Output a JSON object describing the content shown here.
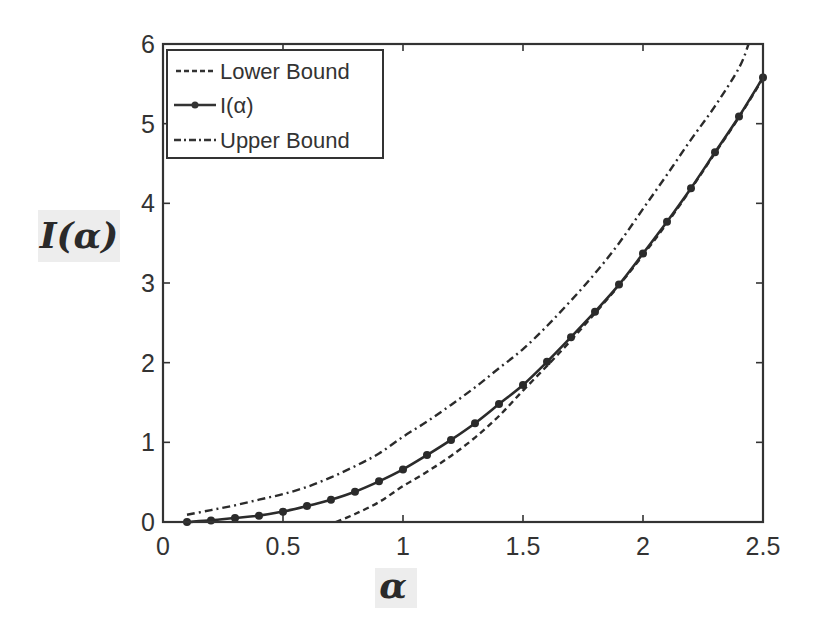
{
  "chart_data": {
    "type": "line",
    "title": "",
    "xlabel": "α",
    "ylabel": "I(α)",
    "xlim": [
      0,
      2.5
    ],
    "ylim": [
      0,
      6
    ],
    "xticks": [
      0,
      0.5,
      1,
      1.5,
      2,
      2.5
    ],
    "xtick_labels": [
      "0",
      "0.5",
      "1",
      "1.5",
      "2",
      "2.5"
    ],
    "yticks": [
      0,
      1,
      2,
      3,
      4,
      5,
      6
    ],
    "ytick_labels": [
      "0",
      "1",
      "2",
      "3",
      "4",
      "5",
      "6"
    ],
    "grid": false,
    "legend_position": "upper left",
    "series": [
      {
        "name": "Lower Bound",
        "style": "dashed",
        "x": [
          0.72,
          0.8,
          0.9,
          1.0,
          1.1,
          1.2,
          1.3,
          1.4,
          1.5,
          1.6,
          1.7,
          1.8,
          1.9,
          2.0,
          2.1,
          2.2,
          2.3,
          2.4,
          2.5
        ],
        "values": [
          0.0,
          0.1,
          0.25,
          0.45,
          0.63,
          0.83,
          1.06,
          1.33,
          1.65,
          1.96,
          2.28,
          2.62,
          2.97,
          3.35,
          3.75,
          4.18,
          4.63,
          5.08,
          5.57
        ]
      },
      {
        "name": "I(α)",
        "style": "solid-dot-markers",
        "x": [
          0.1,
          0.2,
          0.3,
          0.4,
          0.5,
          0.6,
          0.7,
          0.8,
          0.9,
          1.0,
          1.1,
          1.2,
          1.3,
          1.4,
          1.5,
          1.6,
          1.7,
          1.8,
          1.9,
          2.0,
          2.1,
          2.2,
          2.3,
          2.4,
          2.5
        ],
        "values": [
          0.0,
          0.02,
          0.05,
          0.08,
          0.13,
          0.2,
          0.28,
          0.38,
          0.51,
          0.66,
          0.84,
          1.03,
          1.24,
          1.48,
          1.72,
          2.01,
          2.32,
          2.64,
          2.98,
          3.37,
          3.77,
          4.19,
          4.64,
          5.09,
          5.58
        ]
      },
      {
        "name": "Upper Bound",
        "style": "dash-dot",
        "x": [
          0.1,
          0.2,
          0.3,
          0.4,
          0.5,
          0.6,
          0.7,
          0.8,
          0.9,
          1.0,
          1.1,
          1.2,
          1.3,
          1.4,
          1.5,
          1.6,
          1.7,
          1.8,
          1.9,
          2.0,
          2.1,
          2.2,
          2.3,
          2.4,
          2.44
        ],
        "values": [
          0.09,
          0.15,
          0.21,
          0.28,
          0.35,
          0.44,
          0.56,
          0.7,
          0.86,
          1.07,
          1.26,
          1.47,
          1.69,
          1.93,
          2.17,
          2.46,
          2.78,
          3.12,
          3.5,
          3.93,
          4.36,
          4.8,
          5.22,
          5.7,
          6.0
        ]
      }
    ]
  },
  "legend": {
    "items": [
      {
        "label": "Lower Bound"
      },
      {
        "label": "I(α)"
      },
      {
        "label": "Upper Bound"
      }
    ]
  },
  "axes": {
    "xlabel": "α",
    "ylabel": "I(α)"
  },
  "colors": {
    "line": "#2b2b2b",
    "axis": "#333333",
    "label_bg": "#ececec"
  }
}
